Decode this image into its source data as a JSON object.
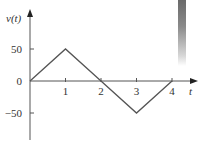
{
  "chart_data": {
    "type": "line",
    "title": "",
    "xlabel": "t",
    "ylabel": "v(t)",
    "x": [
      0,
      1,
      2,
      3,
      4
    ],
    "series": [
      {
        "name": "v(t)",
        "values": [
          0,
          50,
          0,
          -50,
          0
        ]
      }
    ],
    "xticks": [
      "1",
      "2",
      "3",
      "4"
    ],
    "yticks": [
      "50",
      "0",
      "−50"
    ],
    "xlim": [
      0,
      4.7
    ],
    "ylim": [
      -60,
      65
    ],
    "grid": false,
    "legend": "none",
    "color": "#555555",
    "axis_color": "#555555"
  }
}
